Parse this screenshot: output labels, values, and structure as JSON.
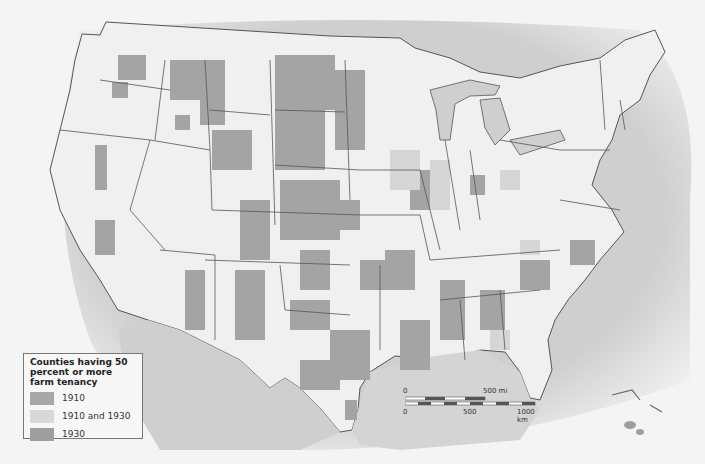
{
  "title": "Counties having 50 percent or more farm tenancy",
  "colors": {
    "ocean": "#cfcfcf",
    "land": "#f0f0f0",
    "tenancy_1910": "#a8a8a8",
    "tenancy_1910_and_1930": "#d8d8d8",
    "tenancy_1930": "#9e9e9e",
    "border": "#555555"
  },
  "legend": {
    "title": "Counties having 50 percent or more farm tenancy",
    "items": [
      {
        "label": "1910",
        "color": "#a8a8a8"
      },
      {
        "label": "1910 and 1930",
        "color": "#d8d8d8"
      },
      {
        "label": "1930",
        "color": "#9e9e9e"
      }
    ]
  },
  "scale_bar": {
    "mi_start": "0",
    "mi_end": "500 mi",
    "km_start": "0",
    "km_mid": "500",
    "km_end": "1000 km"
  }
}
